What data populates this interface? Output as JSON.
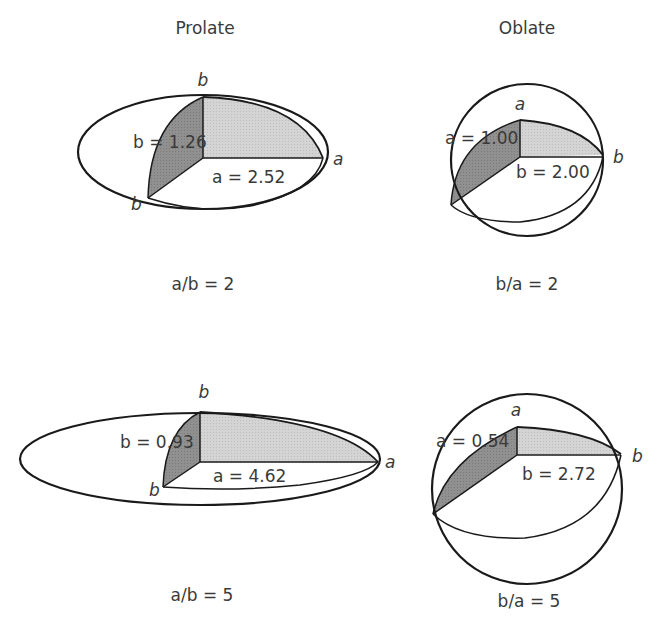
{
  "columns": {
    "prolate_title": "Prolate",
    "oblate_title": "Oblate"
  },
  "panels": [
    {
      "id": "prolate-2",
      "shape": "prolate",
      "caption": "a/b = 2",
      "axis_top_label": "b",
      "axis_right_label": "a",
      "axis_bottom_left_label": "b",
      "dim_vertical": "b = 1.26",
      "dim_horizontal": "a = 2.52"
    },
    {
      "id": "oblate-2",
      "shape": "oblate",
      "caption": "b/a = 2",
      "axis_top_label": "a",
      "axis_right_label": "b",
      "dim_vertical": "a = 1.00",
      "dim_horizontal": "b = 2.00"
    },
    {
      "id": "prolate-5",
      "shape": "prolate",
      "caption": "a/b = 5",
      "axis_top_label": "b",
      "axis_right_label": "a",
      "axis_bottom_left_label": "b",
      "dim_vertical": "b = 0.93",
      "dim_horizontal": "a = 4.62"
    },
    {
      "id": "oblate-5",
      "shape": "oblate",
      "caption": "b/a = 5",
      "axis_top_label": "a",
      "axis_right_label": "b",
      "dim_vertical": "a = 0.54",
      "dim_horizontal": "b = 2.72"
    }
  ],
  "colors": {
    "outline": "#1a1a1a",
    "light_fill": "#cfcfcf",
    "dark_fill": "#8c8c8c",
    "text": "#3a3a3a"
  }
}
